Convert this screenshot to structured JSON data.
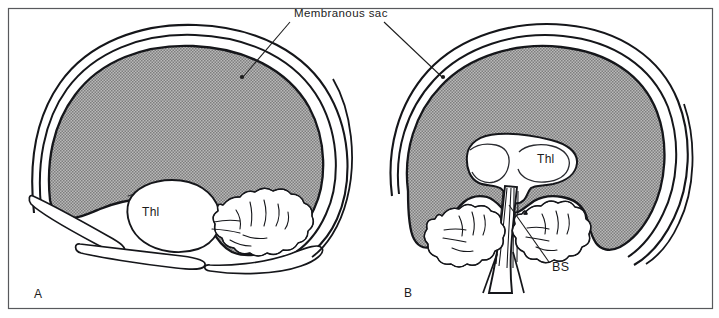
{
  "figure": {
    "type": "anatomical-line-drawing",
    "background_color": "#ffffff",
    "ink_color": "#15161a",
    "shaded_fill_color": "#9a9a9a",
    "frame_color": "#58595c"
  },
  "annotations": {
    "membranous_sac": {
      "text": "Membranous  sac",
      "x": 294,
      "y": 17,
      "leader_endpoints": [
        {
          "x": 242,
          "y": 77
        },
        {
          "x": 443,
          "y": 77
        }
      ]
    },
    "panel_a": {
      "letter": "A",
      "x": 34,
      "y": 298,
      "labels": [
        {
          "name": "thalamus",
          "text": "Thl",
          "x": 142,
          "y": 216
        }
      ]
    },
    "panel_b": {
      "letter": "B",
      "x": 404,
      "y": 297,
      "labels": [
        {
          "name": "thalamus",
          "text": "Thl",
          "x": 537,
          "y": 163
        },
        {
          "name": "brainstem",
          "text": "BS",
          "x": 552,
          "y": 271
        }
      ]
    }
  },
  "structures": [
    {
      "name": "membranous-sac-outline",
      "panel": "A",
      "kind": "double-contour"
    },
    {
      "name": "cerebral-mantle-shaded",
      "panel": "A",
      "kind": "shaded-mass"
    },
    {
      "name": "thalamus",
      "panel": "A",
      "kind": "white-ovoid"
    },
    {
      "name": "cerebellum",
      "panel": "A",
      "kind": "foliated-arbor-vitae"
    },
    {
      "name": "skull-base-sliver",
      "panel": "A",
      "kind": "elongated-sliver"
    },
    {
      "name": "membranous-sac-outline",
      "panel": "B",
      "kind": "double-contour"
    },
    {
      "name": "cerebral-mantle-shaded",
      "panel": "B",
      "kind": "shaded-mass"
    },
    {
      "name": "thalamus",
      "panel": "B",
      "kind": "white-mushroom-cap"
    },
    {
      "name": "brainstem",
      "panel": "B",
      "kind": "vertical-striated-column"
    },
    {
      "name": "cerebellar-hemisphere-left",
      "panel": "B",
      "kind": "foliated-arbor-vitae"
    },
    {
      "name": "cerebellar-hemisphere-right",
      "panel": "B",
      "kind": "foliated-arbor-vitae"
    }
  ]
}
